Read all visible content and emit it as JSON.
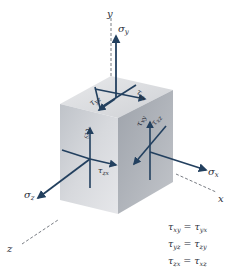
{
  "diagram": {
    "axes": {
      "y": "y",
      "x": "x",
      "z": "z"
    },
    "normal_stresses": {
      "sigma_y": {
        "symbol": "σ",
        "sub": "y"
      },
      "sigma_x": {
        "symbol": "σ",
        "sub": "x"
      },
      "sigma_z": {
        "symbol": "σ",
        "sub": "z"
      }
    },
    "shear_stresses": {
      "top": [
        {
          "symbol": "τ",
          "sub": "yz"
        },
        {
          "symbol": "τ",
          "sub": "yx"
        }
      ],
      "front": [
        {
          "symbol": "τ",
          "sub": "zy"
        },
        {
          "symbol": "τ",
          "sub": "zx"
        }
      ],
      "right": [
        {
          "symbol": "τ",
          "sub": "xy"
        },
        {
          "symbol": "τ",
          "sub": "xz"
        }
      ]
    },
    "equations": [
      {
        "lhs": "τ",
        "lhs_sub": "xy",
        "op": "=",
        "rhs": "τ",
        "rhs_sub": "yx"
      },
      {
        "lhs": "τ",
        "lhs_sub": "yz",
        "op": "=",
        "rhs": "τ",
        "rhs_sub": "zy"
      },
      {
        "lhs": "τ",
        "lhs_sub": "zx",
        "op": "=",
        "rhs": "τ",
        "rhs_sub": "xz"
      }
    ],
    "colors": {
      "arrow": "#23405f",
      "top_face": "#dcdde0",
      "front_face": "#c9ccd1",
      "right_face": "#a9adb4",
      "axis_dash": "#555a63"
    }
  }
}
